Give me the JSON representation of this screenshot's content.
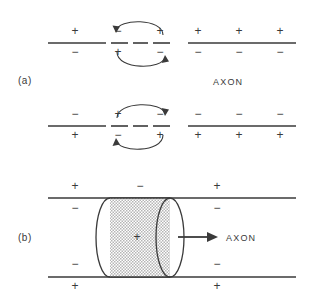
{
  "figure": {
    "type": "diagram",
    "panels": [
      {
        "id": "a",
        "label": "(a)",
        "axon_label": "AXON",
        "description": "Two membrane lines with local circuit current loops at the active (dashed) region",
        "membranes": [
          {
            "id": "upper",
            "outside_signs": [
              "+",
              "−",
              "+",
              "+",
              "+",
              "+"
            ],
            "inside_signs": [
              "−",
              "+",
              "−",
              "−",
              "−",
              "−"
            ],
            "active_segment": "dashed",
            "arrow_outside_direction": "left",
            "arrow_inside_direction": "right"
          },
          {
            "id": "lower",
            "outside_signs": [
              "−",
              "+",
              "−",
              "−",
              "−",
              "−"
            ],
            "inside_signs": [
              "+",
              "−",
              "+",
              "+",
              "+",
              "+"
            ],
            "active_segment": "dashed",
            "arrow_outside_direction": "right",
            "arrow_inside_direction": "left"
          }
        ]
      },
      {
        "id": "b",
        "label": "(b)",
        "axon_label": "AXON",
        "description": "Cylindrical shaded region of depolarization travelling to the right",
        "membrane_top_outside_signs": [
          "+",
          "−",
          "+"
        ],
        "membrane_top_inside_signs": [
          "−",
          "−"
        ],
        "membrane_bottom_inside_signs": [
          "−",
          "−"
        ],
        "membrane_bottom_outside_signs": [
          "+",
          "+"
        ],
        "cylinder_interior_sign": "+",
        "propagation_arrow_direction": "right"
      }
    ],
    "colors": {
      "ink": "#3a3a3a",
      "background": "#ffffff",
      "cylinder_fill": "#c9c9c9"
    }
  }
}
